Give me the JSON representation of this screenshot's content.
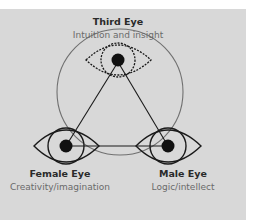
{
  "diagram": {
    "background_color": "#d8d8d8",
    "line_color": "#1a1a1a",
    "circle_color": "#707070",
    "nodes": [
      {
        "id": "third-eye",
        "title": "Third Eye",
        "subtitle": "Intuition and insight",
        "style": "dashed"
      },
      {
        "id": "female-eye",
        "title": "Female Eye",
        "subtitle": "Creativity/imagination",
        "style": "solid"
      },
      {
        "id": "male-eye",
        "title": "Male Eye",
        "subtitle": "Logic/intellect",
        "style": "solid"
      }
    ],
    "edges": [
      {
        "from": "third-eye",
        "to": "female-eye"
      },
      {
        "from": "third-eye",
        "to": "male-eye"
      },
      {
        "from": "female-eye",
        "to": "male-eye"
      }
    ]
  }
}
